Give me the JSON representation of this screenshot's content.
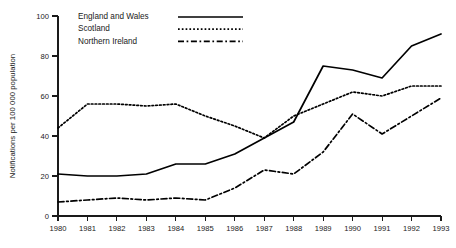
{
  "chart_data": {
    "type": "line",
    "title": "",
    "subtitle": "",
    "xlabel": "",
    "ylabel": "Notifications per 100 000 population",
    "x": [
      1980,
      1981,
      1982,
      1983,
      1984,
      1985,
      1986,
      1987,
      1988,
      1989,
      1990,
      1991,
      1992,
      1993
    ],
    "categories": [
      "1980",
      "1981",
      "1982",
      "1983",
      "1984",
      "1985",
      "1986",
      "1987",
      "1988",
      "1989",
      "1990",
      "1991",
      "1992",
      "1993"
    ],
    "xlim": [
      1980,
      1993
    ],
    "ylim": [
      0,
      100
    ],
    "y_ticks": [
      0,
      20,
      40,
      60,
      80,
      100
    ],
    "y_tick_labels": [
      "0",
      "20",
      "40",
      "60",
      "80",
      "100"
    ],
    "x_tick_labels": [
      "1980",
      "1981",
      "1982",
      "1983",
      "1984",
      "1985",
      "1986",
      "1987",
      "1988",
      "1989",
      "1990",
      "1991",
      "1992",
      "1993"
    ],
    "grid": false,
    "legend_position": "top-left-inside",
    "series": [
      {
        "name": "England and Wales",
        "line_style": "solid",
        "color": "#000000",
        "values": [
          21,
          20,
          20,
          21,
          26,
          26,
          31,
          39,
          47,
          75,
          73,
          69,
          85,
          91
        ]
      },
      {
        "name": "Scotland",
        "line_style": "dotted",
        "color": "#000000",
        "values": [
          44,
          56,
          56,
          55,
          56,
          50,
          45,
          39,
          50,
          56,
          62,
          60,
          65,
          65
        ]
      },
      {
        "name": "Northern Ireland",
        "line_style": "dash-dot",
        "color": "#000000",
        "values": [
          7,
          8,
          9,
          8,
          9,
          8,
          14,
          23,
          21,
          32,
          51,
          41,
          50,
          59
        ]
      }
    ]
  },
  "legend": {
    "entries": [
      {
        "label": "England and Wales"
      },
      {
        "label": "Scotland"
      },
      {
        "label": "Northern Ireland"
      }
    ]
  },
  "axes": {
    "y_title": "Notifications per 100 000 population"
  }
}
